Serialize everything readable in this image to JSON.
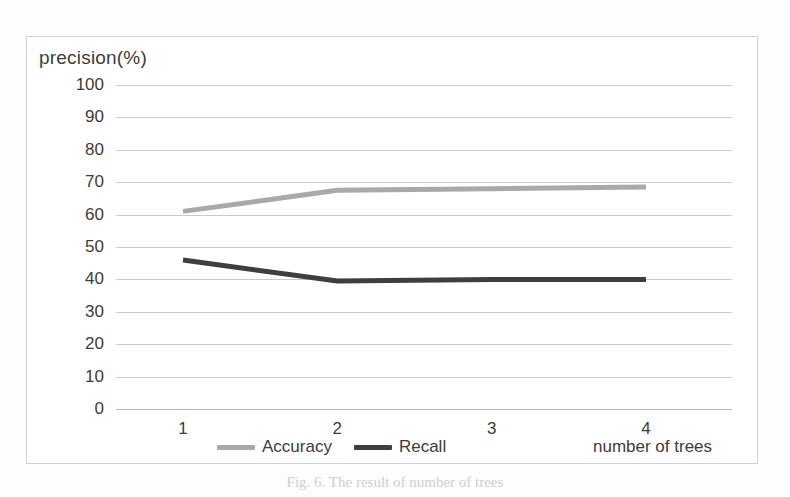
{
  "figure": {
    "caption": "Fig. 6.  The result of number of trees"
  },
  "chart_data": {
    "type": "line",
    "title": "",
    "xlabel": "number of trees",
    "ylabel": "precision(%)",
    "x": [
      1,
      2,
      3,
      4
    ],
    "xtick_labels": [
      "1",
      "2",
      "3",
      "4"
    ],
    "ytick_labels": [
      "100",
      "90",
      "80",
      "70",
      "60",
      "50",
      "40",
      "30",
      "20",
      "10",
      "0"
    ],
    "yticks": [
      100,
      90,
      80,
      70,
      60,
      50,
      40,
      30,
      20,
      10,
      0
    ],
    "ylim": [
      0,
      100
    ],
    "grid": true,
    "legend_position": "bottom",
    "series": [
      {
        "name": "Accuracy",
        "color": "#a9a9a9",
        "values": [
          61,
          67.5,
          68,
          68.5
        ]
      },
      {
        "name": "Recall",
        "color": "#3f3f3f",
        "values": [
          46,
          39.5,
          40,
          40
        ]
      }
    ]
  },
  "legend": {
    "items": [
      {
        "label": "Accuracy",
        "color": "#a9a9a9"
      },
      {
        "label": "Recall",
        "color": "#3f3f3f"
      }
    ]
  }
}
